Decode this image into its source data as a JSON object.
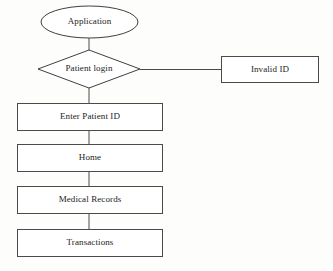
{
  "diagram": {
    "type": "flowchart",
    "background_color": "#fdfdfc",
    "stroke_color": "#4a4a4a",
    "text_color": "#1b1b1b",
    "fill_color": "#ffffff",
    "nodes": [
      {
        "id": "application",
        "label": "Application",
        "shape": "ellipse",
        "x": 41,
        "y": 6,
        "width": 97,
        "height": 32
      },
      {
        "id": "patient-login",
        "label": "Patient login",
        "shape": "diamond",
        "x": 38,
        "y": 50,
        "width": 102,
        "height": 38
      },
      {
        "id": "invalid-id",
        "label": "Invalid ID",
        "shape": "rectangle",
        "x": 221,
        "y": 56,
        "width": 98,
        "height": 27
      },
      {
        "id": "enter-patient-id",
        "label": "Enter Patient ID",
        "shape": "rectangle",
        "x": 17,
        "y": 103,
        "width": 146,
        "height": 28
      },
      {
        "id": "home",
        "label": "Home",
        "shape": "rectangle",
        "x": 17,
        "y": 144,
        "width": 146,
        "height": 28
      },
      {
        "id": "medical-records",
        "label": "Medical Records",
        "shape": "rectangle",
        "x": 17,
        "y": 186,
        "width": 146,
        "height": 28
      },
      {
        "id": "transactions",
        "label": "Transactions",
        "shape": "rectangle",
        "x": 17,
        "y": 229,
        "width": 146,
        "height": 28
      }
    ],
    "connectors": [
      {
        "id": "application-to-patient-login",
        "from": "application",
        "to": "patient-login",
        "orientation": "vertical"
      },
      {
        "id": "patient-login-to-invalid-id",
        "from": "patient-login",
        "to": "invalid-id",
        "orientation": "horizontal"
      },
      {
        "id": "patient-login-to-enter-patient-id",
        "from": "patient-login",
        "to": "enter-patient-id",
        "orientation": "vertical"
      },
      {
        "id": "enter-patient-id-to-home",
        "from": "enter-patient-id",
        "to": "home",
        "orientation": "vertical"
      },
      {
        "id": "home-to-medical-records",
        "from": "home",
        "to": "medical-records",
        "orientation": "vertical"
      },
      {
        "id": "medical-records-to-transactions",
        "from": "medical-records",
        "to": "transactions",
        "orientation": "vertical"
      }
    ]
  }
}
